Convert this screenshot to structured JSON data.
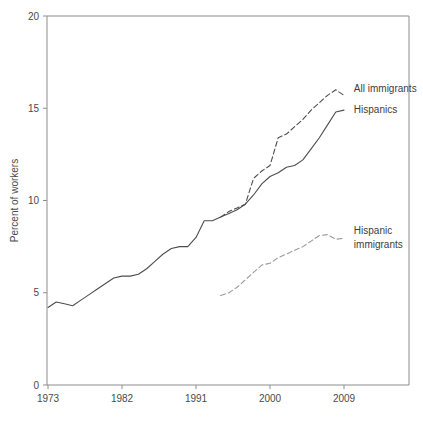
{
  "chart_data": {
    "type": "line",
    "title": "",
    "subtitle": "",
    "xlabel": "",
    "ylabel": "Percent of workers",
    "xlim": [
      1973,
      1982.5
    ],
    "ylim": [
      0,
      20
    ],
    "yticks": [
      0,
      5,
      10,
      15,
      20
    ],
    "xticks": [
      1973,
      1982,
      1991,
      2000,
      2009
    ],
    "xtick_labels": [
      "1973",
      "1982",
      "1991",
      "2000",
      "2009"
    ],
    "ytick_labels": [
      "0",
      "5",
      "10",
      "15",
      "20"
    ],
    "grid": false,
    "legend_position": "inline-right-of-line-ends",
    "x_axis_range": [
      1973,
      2012
    ],
    "series": [
      {
        "name": "Hispanics",
        "label": "Hispanics",
        "style": "solid",
        "color": "#4d4d4d",
        "x": [
          1973,
          1974,
          1975,
          1976,
          1977,
          1978,
          1979,
          1980,
          1981,
          1982,
          1983,
          1984,
          1985,
          1986,
          1987,
          1988,
          1989,
          1990,
          1991,
          1992,
          1993,
          1994,
          1995,
          1996,
          1997,
          1998,
          1999,
          2000,
          2001,
          2002,
          2003,
          2004,
          2005,
          2006,
          2007,
          2008,
          2009
        ],
        "values": [
          4.2,
          4.5,
          4.4,
          4.3,
          4.6,
          4.9,
          5.2,
          5.5,
          5.8,
          5.9,
          5.9,
          6.0,
          6.3,
          6.7,
          7.1,
          7.4,
          7.5,
          7.5,
          8.0,
          8.9,
          8.9,
          9.1,
          9.3,
          9.5,
          9.8,
          10.3,
          10.9,
          11.3,
          11.5,
          11.8,
          11.9,
          12.2,
          12.8,
          13.4,
          14.1,
          14.8,
          14.9
        ]
      },
      {
        "name": "All immigrants",
        "label": "All immigrants",
        "style": "dashed",
        "color": "#4d4d4d",
        "x": [
          1994,
          1995,
          1996,
          1997,
          1998,
          1999,
          2000,
          2001,
          2002,
          2003,
          2004,
          2005,
          2006,
          2007,
          2008,
          2009
        ],
        "values": [
          9.1,
          9.4,
          9.6,
          9.8,
          11.2,
          11.6,
          11.9,
          13.4,
          13.6,
          14.0,
          14.4,
          14.9,
          15.3,
          15.7,
          16.0,
          15.7
        ]
      },
      {
        "name": "Hispanic immigrants",
        "label": "Hispanic immigrants",
        "label_lines": [
          "Hispanic",
          "immigrants"
        ],
        "style": "dashed",
        "color": "#9a9a9a",
        "x": [
          1994,
          1995,
          1996,
          1997,
          1998,
          1999,
          2000,
          2001,
          2002,
          2003,
          2004,
          2005,
          2006,
          2007,
          2008,
          2009
        ],
        "values": [
          4.85,
          5.0,
          5.3,
          5.7,
          6.1,
          6.5,
          6.6,
          6.9,
          7.1,
          7.3,
          7.5,
          7.8,
          8.1,
          8.15,
          7.9,
          7.95
        ]
      }
    ],
    "annotations": [
      {
        "text": "All immigrants",
        "x": 2010.2,
        "y": 16.05
      },
      {
        "text": "Hispanics",
        "x": 2010.2,
        "y": 14.95
      },
      {
        "text": "Hispanic",
        "x": 2010.2,
        "y": 8.35
      },
      {
        "text": "immigrants",
        "x": 2010.2,
        "y": 7.6
      }
    ]
  },
  "colors": {
    "frame": "#8d8d8d",
    "text": "#4a4a4a",
    "series_dark": "#4d4d4d",
    "series_light": "#9a9a9a",
    "background": "#ffffff"
  }
}
